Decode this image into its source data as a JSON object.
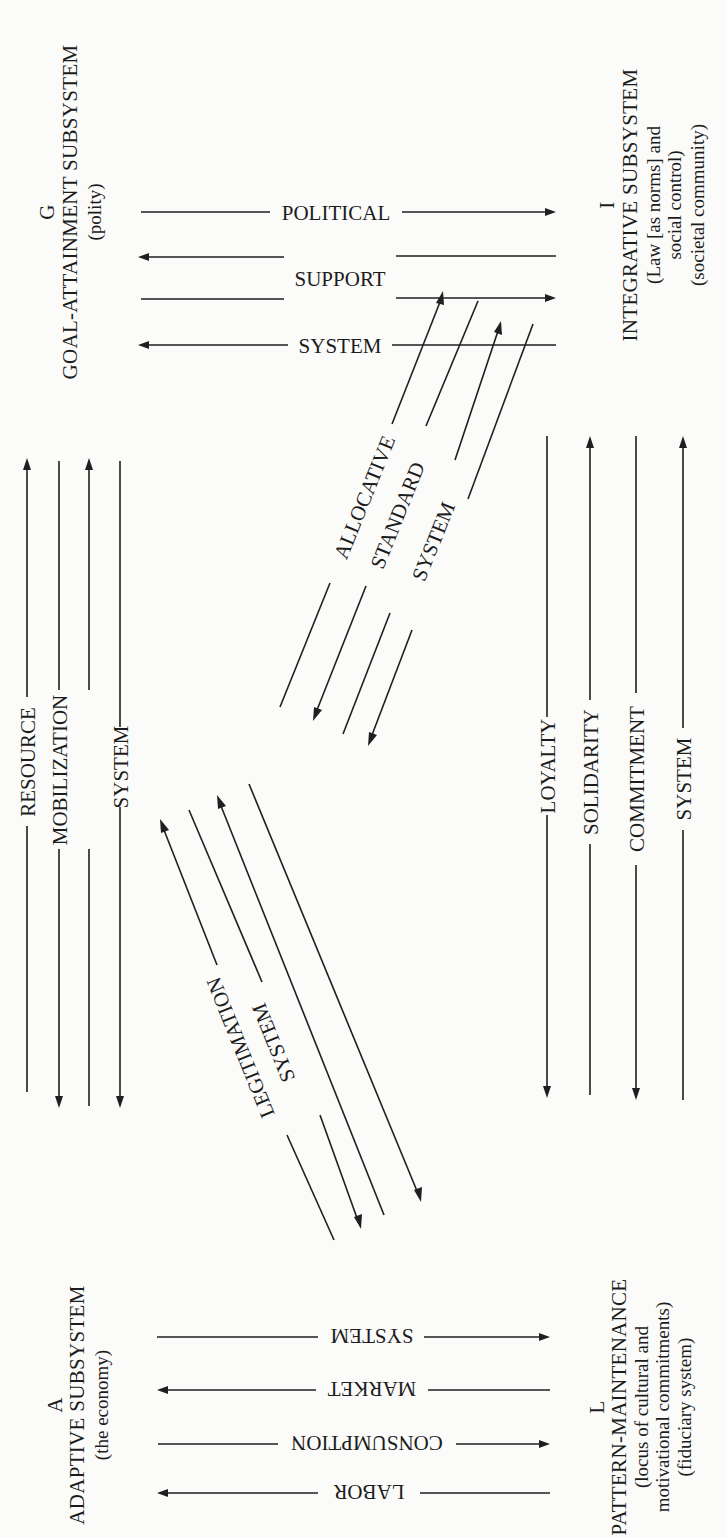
{
  "figure": {
    "orientation": "rotated 90 degrees counterclockwise",
    "colors": {
      "ink": "#1f1f1f",
      "paper": "#fbfbfa"
    }
  },
  "subsystems": {
    "G": {
      "letter": "G",
      "title": "GOAL-ATTAINMENT SUBSYSTEM",
      "lines": [
        "(polity)"
      ]
    },
    "I": {
      "letter": "I",
      "title": "INTEGRATIVE SUBSYSTEM",
      "lines": [
        "(Law [as norms] and",
        "social control)",
        "(societal community)"
      ]
    },
    "A": {
      "letter": "A",
      "title": "ADAPTIVE SUBSYSTEM",
      "lines": [
        "(the economy)"
      ]
    },
    "L": {
      "letter": "L",
      "title": "PATTERN-MAINTENANCE",
      "lines": [
        "(locus of cultural and",
        "motivational commitments)",
        "(fiduciary system)"
      ]
    }
  },
  "interchanges": {
    "political_support": {
      "between": [
        "G",
        "I"
      ],
      "words": [
        "POLITICAL",
        "SUPPORT",
        "SYSTEM"
      ]
    },
    "market": {
      "between": [
        "A",
        "L"
      ],
      "words": [
        "LABOR",
        "CONSUMPTION",
        "MARKET",
        "SYSTEM"
      ]
    },
    "resource_mobilization": {
      "between": [
        "A",
        "G"
      ],
      "words": [
        "RESOURCE",
        "MOBILIZATION",
        "SYSTEM"
      ]
    },
    "solidarity": {
      "between": [
        "L",
        "I"
      ],
      "words": [
        "LOYALTY",
        "SOLIDARITY",
        "COMMITMENT",
        "SYSTEM"
      ]
    },
    "allocative_standard": {
      "between": [
        "I",
        "A"
      ],
      "words": [
        "ALLOCATIVE",
        "STANDARD",
        "SYSTEM"
      ]
    },
    "legitimation": {
      "between": [
        "G",
        "L"
      ],
      "words": [
        "LEGITIMATION",
        "SYSTEM"
      ]
    }
  }
}
